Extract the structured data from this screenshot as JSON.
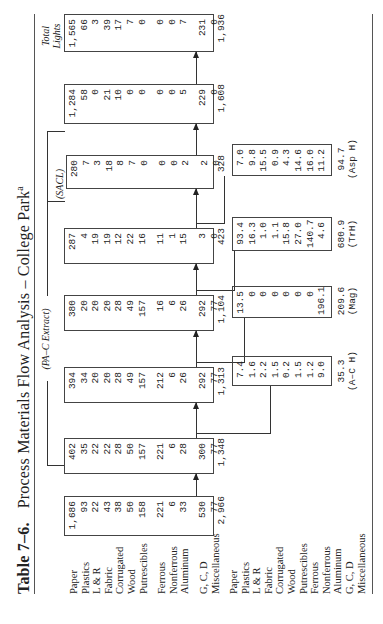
{
  "title": {
    "number": "Table 7–6.",
    "text": "Process Materials Flow Analysis – College Park",
    "footnote_mark": "a"
  },
  "labels_top": [
    "Paper",
    "Plastics",
    "L & R",
    "Fabric",
    "Corrugated",
    "Wood",
    "Putrescibles",
    "Ferrous",
    "Nonferrous",
    "Aluminum",
    "G, C, D",
    "Miscellaneous"
  ],
  "labels_bottom": [
    "Paper",
    "Plastics",
    "L & R",
    "Fabric",
    "Corrugated",
    "Wood",
    "Putrescibles",
    "Ferrous",
    "Nonferrous",
    "Aluminum",
    "G, C, D",
    "Miscellaneous"
  ],
  "headers": {
    "pac_extract": "(PA–C Extract)",
    "sacl": "(SACL)",
    "total_lights_1": "Total",
    "total_lights_2": "Lights"
  },
  "flow_boxes": [
    {
      "values": [
        "1,686",
        "93",
        "22",
        "43",
        "38",
        "50",
        "158",
        "221",
        "6",
        "33",
        "530",
        "77"
      ],
      "total": "2,966"
    },
    {
      "values": [
        "402",
        "35",
        "22",
        "22",
        "28",
        "50",
        "157",
        "221",
        "6",
        "28",
        "300",
        "77"
      ],
      "total": "1,348"
    },
    {
      "values": [
        "394",
        "34",
        "20",
        "20",
        "28",
        "49",
        "157",
        "212",
        "6",
        "26",
        "292",
        "77"
      ],
      "total": "1,313"
    },
    {
      "values": [
        "380",
        "20",
        "20",
        "20",
        "28",
        "49",
        "157",
        "16",
        "6",
        "26",
        "292",
        "77"
      ],
      "total": "1,104"
    },
    {
      "values": [
        "287",
        "4",
        "19",
        "19",
        "12",
        "22",
        "16",
        "11",
        "1",
        "15",
        "3",
        "0"
      ],
      "total": "423"
    },
    {
      "values": [
        "280",
        "7",
        "3",
        "18",
        "8",
        "7",
        "0",
        "0",
        "0",
        "2",
        "2",
        "0"
      ],
      "total": "328"
    },
    {
      "values": [
        "1,284",
        "58",
        "0",
        "21",
        "10",
        "0",
        "0",
        "0",
        "0",
        "5",
        "229",
        "0"
      ],
      "total": "1,608"
    },
    {
      "values": [
        "1,565",
        "66",
        "3",
        "39",
        "17",
        "7",
        "0",
        "0",
        "0",
        "7",
        "231",
        "0"
      ],
      "total": "1,936"
    }
  ],
  "extract_boxes": [
    {
      "values": [
        "7.4",
        "1.6",
        "2.2",
        "1.5",
        "0.2",
        "1.5",
        "1.2",
        "9.0",
        "0",
        "1.8",
        "8.9",
        "0"
      ],
      "total": "35.3",
      "label": "(A–C H)"
    },
    {
      "values": [
        "13.5",
        "0",
        "0",
        "0",
        "0",
        "0",
        "0",
        "196.1",
        "0",
        "0",
        "0",
        "0"
      ],
      "total": "209.6",
      "label": "(Mag)"
    },
    {
      "values": [
        "93.4",
        "16.3",
        "1.0",
        "1.1",
        "15.8",
        "27.0",
        "140.7",
        "4.6",
        "5.0",
        "10.9",
        "288.2",
        "76.9"
      ],
      "total": "680.9",
      "label": "(TrH)"
    },
    {
      "values": [
        "7.0",
        "9.8",
        "15.5",
        "0.9",
        "4.3",
        "14.6",
        "16.0",
        "11.2",
        "0.9",
        "13.4",
        "1.1",
        "0"
      ],
      "total": "94.7",
      "label": "(Asp H)"
    }
  ]
}
